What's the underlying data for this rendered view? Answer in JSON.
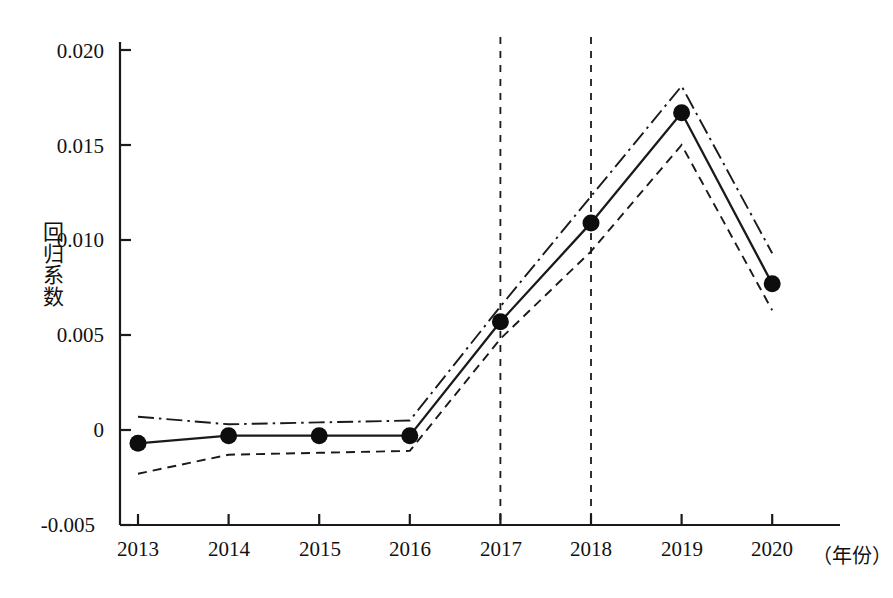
{
  "chart_data": {
    "type": "line",
    "title": "",
    "xlabel": "（年份）",
    "ylabel": "回归系数",
    "x": [
      2013,
      2014,
      2015,
      2016,
      2017,
      2018,
      2019,
      2020
    ],
    "xtick_labels": [
      "2013",
      "2014",
      "2015",
      "2016",
      "2017",
      "2018",
      "2019",
      "2020"
    ],
    "ytick_labels": [
      "0.020",
      "0.015",
      "0.010",
      "0.005",
      "0",
      "-0.005"
    ],
    "ytick_values": [
      0.02,
      0.015,
      0.01,
      0.005,
      0,
      -0.005
    ],
    "ylim": [
      -0.005,
      0.0205
    ],
    "xlim": [
      2012.6,
      2020.4
    ],
    "grid": false,
    "legend": "none",
    "series": [
      {
        "name": "估计值",
        "style": "solid-with-markers",
        "marker": "filled-circle",
        "values": [
          -0.0007,
          -0.0003,
          -0.0003,
          -0.0003,
          0.0057,
          0.0109,
          0.0167,
          0.0077
        ]
      },
      {
        "name": "置信区间上限",
        "style": "dash-dot",
        "marker": "none",
        "values": [
          0.0007,
          0.0003,
          0.0004,
          0.0005,
          0.0065,
          0.0123,
          0.0181,
          0.0093
        ]
      },
      {
        "name": "置信区间下限",
        "style": "dashed",
        "marker": "none",
        "values": [
          -0.0023,
          -0.0013,
          -0.0012,
          -0.0011,
          0.0048,
          0.0094,
          0.015,
          0.0063
        ]
      }
    ],
    "reference_lines": [
      {
        "name": "2017参考线",
        "x": 2017,
        "style": "dashed",
        "orientation": "vertical"
      },
      {
        "name": "2018参考线",
        "x": 2018,
        "style": "dashed",
        "orientation": "vertical"
      }
    ]
  },
  "axes": {
    "y_label_chars": [
      "回",
      "归",
      "系",
      "数"
    ]
  }
}
